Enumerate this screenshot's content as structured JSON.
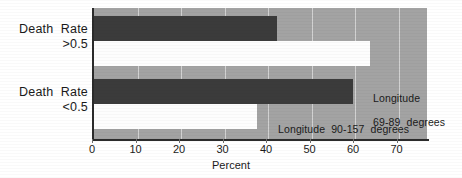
{
  "chart_data": {
    "type": "bar",
    "orientation": "horizontal",
    "title": "",
    "xlabel": "Percent",
    "ylabel": "",
    "categories": [
      "Death  Rate\n>0.5",
      "Death  Rate\n<0.5"
    ],
    "category_lines": [
      {
        "line1": "Death  Rate",
        "line2": ">0.5"
      },
      {
        "line1": "Death  Rate",
        "line2": "<0.5"
      }
    ],
    "series": [
      {
        "name": "Longitude 69-89 degrees",
        "color": "#3b3b3b",
        "values": [
          42,
          59.5
        ]
      },
      {
        "name": "Longitude 90-157 degrees",
        "color": "#fdfdfd",
        "values": [
          63.5,
          37.5
        ]
      }
    ],
    "xlim": [
      0,
      77
    ],
    "xticks": [
      0,
      10,
      20,
      30,
      40,
      50,
      60,
      70
    ],
    "xtick_labels": [
      "0",
      "10",
      "20",
      "30",
      "40",
      "50",
      "60",
      "70"
    ],
    "grid": true,
    "legend": "in-plot annotations",
    "annotations": [
      {
        "id": "annot-0",
        "line1": "Longitude",
        "line2": "69-89  degrees"
      },
      {
        "id": "annot-1",
        "line1": "Longitude  90-157  degrees",
        "line2": ""
      }
    ],
    "plot_background": "#a3a3a3",
    "axis_color": "#2b2b2b",
    "gridline_color": "#d2d2d2"
  }
}
